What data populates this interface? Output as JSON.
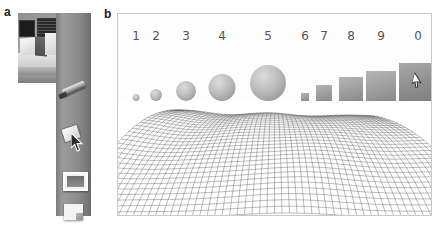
{
  "figure": {
    "panels": [
      {
        "id": "a",
        "label": "a",
        "caption_label": "a"
      },
      {
        "id": "b",
        "label": "b",
        "caption_label": "b"
      }
    ]
  },
  "panel_a": {
    "label": "a",
    "photo_alt": "grayscale photo of desk with two monitors and papers",
    "toolbar": {
      "tools": [
        {
          "id": "pen",
          "name": "pen-tool",
          "label": "Pen"
        },
        {
          "id": "eraser",
          "name": "eraser-tool",
          "label": "Eraser"
        },
        {
          "id": "window",
          "name": "window-tool",
          "label": "Window"
        },
        {
          "id": "page",
          "name": "page-tool",
          "label": "Page"
        }
      ],
      "cursor_icon": "cursor-arrow-icon",
      "selected_tool": "eraser"
    }
  },
  "panel_b": {
    "label": "b",
    "items": [
      {
        "index": 1,
        "label": "1",
        "shape": "circle",
        "size": 7,
        "cx": 18,
        "cursor": false
      },
      {
        "index": 2,
        "label": "2",
        "shape": "circle",
        "size": 12,
        "cx": 38,
        "cursor": false
      },
      {
        "index": 3,
        "label": "3",
        "shape": "circle",
        "size": 20,
        "cx": 68,
        "cursor": false
      },
      {
        "index": 4,
        "label": "4",
        "shape": "circle",
        "size": 27,
        "cx": 104,
        "cursor": false
      },
      {
        "index": 5,
        "label": "5",
        "shape": "circle",
        "size": 36,
        "cx": 150,
        "cursor": false
      },
      {
        "index": 6,
        "label": "6",
        "shape": "square",
        "size": 8,
        "cx": 187,
        "cursor": false
      },
      {
        "index": 7,
        "label": "7",
        "shape": "square",
        "size": 16,
        "cx": 206,
        "cursor": false
      },
      {
        "index": 8,
        "label": "8",
        "shape": "square",
        "size": 24,
        "cx": 233,
        "cursor": false
      },
      {
        "index": 9,
        "label": "9",
        "shape": "square",
        "size": 30,
        "cx": 263,
        "cursor": false
      },
      {
        "index": 0,
        "label": "0",
        "shape": "square",
        "size": 38,
        "cx": 300,
        "cursor": true
      }
    ],
    "mesh": {
      "name": "wireframe-terrain",
      "description": "dense grey wireframe mesh terrain with ridges and valleys"
    }
  },
  "colors": {
    "ink": "#1a1a1a",
    "number_grey": "#555555",
    "panel_border": "#c9c9c9",
    "mesh_line": "#4a4a4a",
    "toolbar_grey": "#8d8d8d"
  }
}
